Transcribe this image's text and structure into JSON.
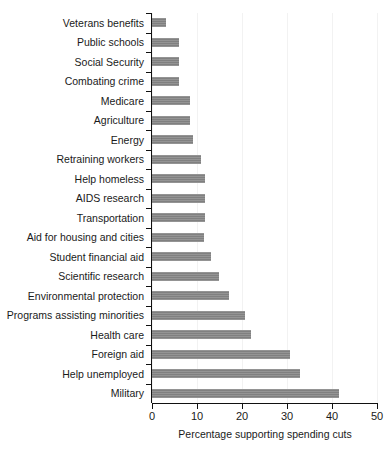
{
  "chart_data": {
    "type": "bar",
    "orientation": "horizontal",
    "title": "",
    "xlabel": "Percentage supporting spending cuts",
    "ylabel": "",
    "xlim": [
      0,
      50
    ],
    "xticks": [
      0,
      10,
      20,
      30,
      40,
      50
    ],
    "xtick_labels": [
      "0",
      "10",
      "20",
      "30",
      "40",
      "50"
    ],
    "grid": true,
    "legend": false,
    "bar_color": "#808080",
    "axis_color": "#111111",
    "categories": [
      "Veterans benefits",
      "Public schools",
      "Social Security",
      "Combating crime",
      "Medicare",
      "Agriculture",
      "Energy",
      "Retraining workers",
      "Help homeless",
      "AIDS research",
      "Transportation",
      "Aid for housing and cities",
      "Student financial aid",
      "Scientific research",
      "Environmental protection",
      "Programs assisting minorities",
      "Health care",
      "Foreign aid",
      "Help unemployed",
      "Military"
    ],
    "values": [
      3.1,
      6.0,
      6.1,
      6.1,
      8.4,
      8.4,
      9.1,
      10.8,
      11.8,
      11.8,
      11.7,
      11.6,
      13.2,
      14.9,
      17.2,
      20.7,
      22.1,
      30.6,
      32.9,
      41.6
    ]
  }
}
